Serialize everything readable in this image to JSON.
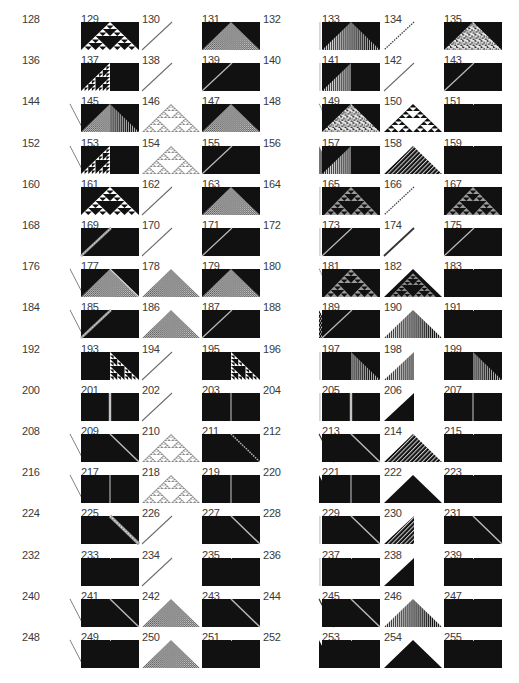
{
  "figure": {
    "colors": {
      "black": "#111111",
      "white": "#ffffff",
      "gray": "#8a8a8a",
      "line": "#6a6a6a",
      "label": "#3a3a3a"
    },
    "columns_x": [
      22,
      81,
      142,
      202,
      263,
      322,
      384,
      444
    ],
    "row_pitch": 41.2,
    "first_row_y": 14,
    "rows": [
      {
        "labels": [
          128,
          129,
          130,
          131,
          132,
          133,
          134,
          135
        ],
        "patterns": [
          "dot",
          "box-sierpinski",
          "diag-r",
          "box-tri-fine",
          "vline",
          "box-tri-stripes",
          "diag-r-dotted",
          "box-tri-chaos"
        ]
      },
      {
        "labels": [
          136,
          137,
          138,
          139,
          140,
          141,
          142,
          143
        ],
        "patterns": [
          "dot",
          "box-left-sierpinski",
          "diag-r",
          "box-diag-r",
          "vline",
          "box-left-stripes",
          "diag-r",
          "box-diag-r"
        ]
      },
      {
        "labels": [
          144,
          145,
          146,
          147,
          148,
          149,
          150,
          151
        ],
        "patterns": [
          "diag-l",
          "box-tri-mixed",
          "tri-sierpinski-open",
          "box-tri-fine",
          "diag-l-dotted",
          "box-tri-chaos",
          "tri-sierpinski-dense",
          "box-plain"
        ]
      },
      {
        "labels": [
          152,
          153,
          154,
          155,
          156,
          157,
          158,
          159
        ],
        "patterns": [
          "diag-l",
          "box-left-sierpinski",
          "tri-sierpinski-open",
          "box-diag-r",
          "tri-l-stripes",
          "box-left-stripes",
          "tri-checker",
          "box-plain"
        ]
      },
      {
        "labels": [
          160,
          161,
          162,
          163,
          164,
          165,
          166,
          167
        ],
        "patterns": [
          "dot",
          "box-sierpinski",
          "diag-r",
          "box-tri-gray",
          "vline",
          "box-sierpinski-gray",
          "diag-r-dotted",
          "box-sierpinski-gray"
        ]
      },
      {
        "labels": [
          168,
          169,
          170,
          171,
          172,
          173,
          174,
          175
        ],
        "patterns": [
          "dot",
          "box-diag-r-wide",
          "diag-r",
          "box-diag-r",
          "vline",
          "box-diag-r",
          "diag-r-thick",
          "box-diag-r"
        ]
      },
      {
        "labels": [
          176,
          177,
          178,
          179,
          180,
          181,
          182,
          183
        ],
        "patterns": [
          "diag-l",
          "box-tri-gray-edge",
          "tri-gray",
          "box-tri-gray",
          "diag-l-dotted",
          "box-sierpinski-gray",
          "tri-sierpinski-dark",
          "box-plain"
        ]
      },
      {
        "labels": [
          184,
          185,
          186,
          187,
          188,
          189,
          190,
          191
        ],
        "patterns": [
          "diag-l",
          "box-diag-r-wide",
          "tri-gray",
          "box-diag-r",
          "tri-l-hatch",
          "box-diag-r",
          "tri-stripes",
          "box-plain"
        ]
      },
      {
        "labels": [
          192,
          193,
          194,
          195,
          196,
          197,
          198,
          199
        ],
        "patterns": [
          "dot",
          "box-right-sierpinski",
          "diag-r",
          "box-right-sierpinski",
          "vline",
          "box-right-stripes",
          "tri-r-stripes",
          "box-right-stripes"
        ]
      },
      {
        "labels": [
          200,
          201,
          202,
          203,
          204,
          205,
          206,
          207
        ],
        "patterns": [
          "dot",
          "box-vline-wide",
          "diag-r",
          "box-vline",
          "vline",
          "box-vline-wide",
          "tri-r-black",
          "box-vline"
        ]
      },
      {
        "labels": [
          208,
          209,
          210,
          211,
          212,
          213,
          214,
          215
        ],
        "patterns": [
          "diag-l",
          "box-diag-l",
          "tri-sierpinski-open",
          "box-diag-l-dotted",
          "diag-l-thick",
          "box-diag-l",
          "tri-checker",
          "box-plain"
        ]
      },
      {
        "labels": [
          216,
          217,
          218,
          219,
          220,
          221,
          222,
          223
        ],
        "patterns": [
          "diag-l",
          "box-vline",
          "tri-sierpinski-open",
          "box-vline",
          "tri-l-black",
          "box-vline",
          "tri-black",
          "box-plain"
        ]
      },
      {
        "labels": [
          224,
          225,
          226,
          227,
          228,
          229,
          230,
          231
        ],
        "patterns": [
          "dot",
          "box-diag-l-wide",
          "diag-r",
          "box-diag-l",
          "vline",
          "box-diag-l",
          "tri-r-hatch",
          "box-diag-l"
        ]
      },
      {
        "labels": [
          232,
          233,
          234,
          235,
          236,
          237,
          238,
          239
        ],
        "patterns": [
          "dot",
          "box-plain",
          "diag-r",
          "box-plain",
          "vline",
          "box-plain",
          "tri-r-black",
          "box-plain"
        ]
      },
      {
        "labels": [
          240,
          241,
          242,
          243,
          244,
          245,
          246,
          247
        ],
        "patterns": [
          "diag-l",
          "box-diag-l",
          "tri-gray",
          "box-diag-l",
          "diag-l-thick",
          "box-diag-l",
          "tri-stripes",
          "box-plain"
        ]
      },
      {
        "labels": [
          248,
          249,
          250,
          251,
          252,
          253,
          254,
          255
        ],
        "patterns": [
          "diag-l",
          "box-plain",
          "tri-gray",
          "box-plain",
          "tri-l-black",
          "box-plain",
          "tri-black",
          "box-plain"
        ]
      }
    ]
  }
}
